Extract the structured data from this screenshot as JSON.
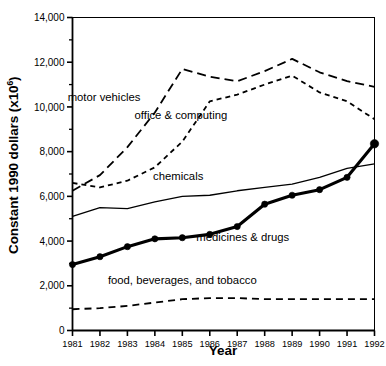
{
  "chart_data": {
    "type": "line",
    "title": "",
    "xlabel": "Year",
    "ylabel": "Constant 1990 dollars (x10⁶)",
    "ylabel_text": "Constant 1990 dollars (x10",
    "ylabel_sup": "6",
    "ylabel_tail": ")",
    "x": [
      1981,
      1982,
      1983,
      1984,
      1985,
      1986,
      1987,
      1988,
      1989,
      1990,
      1991,
      1992
    ],
    "categories": [
      "1981",
      "1982",
      "1983",
      "1984",
      "1985",
      "1986",
      "1987",
      "1988",
      "1989",
      "1990",
      "1991",
      "1992"
    ],
    "xlim": [
      1981,
      1992
    ],
    "ylim": [
      0,
      14000
    ],
    "ytick_values": [
      0,
      2000,
      4000,
      6000,
      8000,
      10000,
      12000,
      14000
    ],
    "ytick_labels": [
      "0",
      "2,000",
      "4,000",
      "6,000",
      "8,000",
      "10,000",
      "12,000",
      "14,000"
    ],
    "yminor_step": 1000,
    "grid": false,
    "legend": "inline-annotations",
    "series": [
      {
        "name": "motor vehicles",
        "style": "long-dashed",
        "color": "#000000",
        "label_x": 1982.15,
        "label_y": 10250,
        "values": [
          6250,
          6950,
          8200,
          9750,
          11700,
          11350,
          11150,
          11600,
          12150,
          11550,
          11150,
          10900
        ]
      },
      {
        "name": "office & computing",
        "style": "short-dashed",
        "color": "#000000",
        "label_x": 1984.95,
        "label_y": 9450,
        "values": [
          6600,
          6400,
          6700,
          7300,
          8450,
          10250,
          10550,
          11000,
          11400,
          10650,
          10250,
          9450
        ]
      },
      {
        "name": "chemicals",
        "style": "solid-thin",
        "color": "#000000",
        "label_x": 1984.85,
        "label_y": 6750,
        "values": [
          5100,
          5500,
          5450,
          5750,
          6000,
          6050,
          6250,
          6400,
          6550,
          6850,
          7250,
          7450
        ]
      },
      {
        "name": "medicines & drugs",
        "style": "solid-thick-markers",
        "color": "#000000",
        "label_x": 1987.2,
        "label_y": 4000,
        "values": [
          2950,
          3300,
          3750,
          4100,
          4150,
          4300,
          4650,
          5650,
          6050,
          6300,
          6850,
          8350
        ]
      },
      {
        "name": "food, beverages, and tobacco",
        "style": "dashed",
        "color": "#000000",
        "label_x": 1985.0,
        "label_y": 2100,
        "values": [
          950,
          1000,
          1100,
          1250,
          1400,
          1450,
          1450,
          1400,
          1400,
          1400,
          1400,
          1400
        ]
      }
    ]
  },
  "axes": {
    "x_title": "Year",
    "y_title_main": "Constant 1990 dollars (x10",
    "y_title_sup": "6",
    "y_title_end": ")"
  }
}
